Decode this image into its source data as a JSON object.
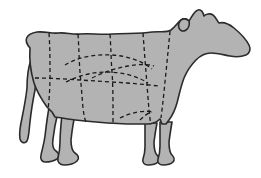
{
  "figure": {
    "subject": "cow",
    "orientation": "facing-right",
    "background_color": "#ffffff",
    "body_fill_color": "#b3b3b3",
    "body_outline_color": "#2b2b2b",
    "body_outline_width": 1.6,
    "cut_line_color": "#1a1a1a",
    "cut_line_width": 1.3,
    "cut_line_dash": "4,3",
    "canvas": {
      "width": 261,
      "height": 178
    }
  },
  "anatomy": {
    "parts": [
      {
        "name": "body",
        "label": "Body"
      },
      {
        "name": "head",
        "label": "Head"
      },
      {
        "name": "ear",
        "label": "Ear"
      },
      {
        "name": "horn",
        "label": "Horn"
      },
      {
        "name": "muzzle",
        "label": "Muzzle"
      },
      {
        "name": "tail",
        "label": "Tail"
      },
      {
        "name": "foreleg-near",
        "label": "Near foreleg"
      },
      {
        "name": "foreleg-far",
        "label": "Far foreleg"
      },
      {
        "name": "hindleg-near",
        "label": "Near hind leg"
      },
      {
        "name": "hindleg-far",
        "label": "Far hind leg"
      },
      {
        "name": "udder",
        "label": "Underline"
      }
    ]
  },
  "shapes": {
    "body_outline_path": "M 30 48 C 23 40 26 34 37 32 C 45 31 52 34 58 33 C 66 32 72 35 80 34 C 90 33 100 35 112 34 C 126 33 140 34 152 32 C 160 31 166 33 171 30 C 175 27 178 22 181 20 C 184 18 187 19 189 21 C 192 17 194 11 198 10 C 201 9 203 12 204 16 C 206 14 210 13 213 15 C 216 17 217 21 219 23 C 223 22 229 24 234 28 C 240 33 246 39 249 45 C 251 49 250 53 246 55 C 241 57 235 57 230 56 C 224 55 217 53 211 53 C 205 53 200 56 196 60 C 191 65 187 71 184 78 C 181 86 179 95 177 103 C 175 110 172 116 169 120 L 166 124 L 162 124 L 160 119 C 157 122 152 124 147 124 L 135 124 C 122 124 108 123 96 122 C 84 121 72 120 62 118 L 55 117 L 52 112 L 47 107 C 42 100 37 92 34 83 C 31 73 29 62 30 48 Z",
    "tail_path": "M 31 60 C 28 68 27 78 27 88 C 26 98 24 108 22 118 C 20 127 19 134 20 139 C 21 143 25 144 27 141 C 29 137 29 130 30 122 C 31 112 33 100 35 90 C 36 80 37 70 37 62 Z",
    "leg_paths": [
      {
        "name": "hindleg-far",
        "d": "M 49 108 C 47 118 46 128 45 136 C 44 144 42 150 41 155 C 40 159 42 162 45 162 C 49 162 54 161 57 159 C 60 157 59 153 56 151 C 53 149 52 145 53 139 C 54 130 56 120 58 112 Z"
      },
      {
        "name": "hindleg-near",
        "d": "M 62 114 C 61 124 60 134 60 142 C 60 149 59 154 58 158 C 57 162 60 165 64 165 C 69 165 74 164 77 161 C 80 158 78 155 75 153 C 72 151 71 146 71 140 C 72 131 73 122 75 116 Z"
      },
      {
        "name": "foreleg-far",
        "d": "M 145 123 C 145 132 145 140 145 147 C 145 152 144 156 143 159 C 142 162 144 165 148 165 C 152 165 156 164 158 162 C 160 160 159 157 157 155 C 155 153 154 148 154 142 C 155 134 156 128 157 123 Z"
      },
      {
        "name": "foreleg-near",
        "d": "M 160 122 C 160 131 160 139 160 146 C 160 151 159 156 158 159 C 157 162 159 165 163 165 C 167 165 171 164 173 162 C 175 160 174 157 172 155 C 170 153 169 148 169 142 C 170 134 171 128 172 122 Z"
      }
    ],
    "cut_lines": [
      {
        "name": "cut-line-chuck-rib-vertical",
        "d": "M 49 33 C 50 48 50 62 50 76 C 50 90 49 100 48 110"
      },
      {
        "name": "cut-line-rib-loin-vertical",
        "d": "M 78 34 C 79 48 79 60 80 72 C 81 84 82 96 83 108 C 84 116 85 120 86 122"
      },
      {
        "name": "cut-line-loin-sirloin-vertical",
        "d": "M 110 34 C 111 48 111 60 112 72 C 113 86 113 100 113 112 C 113 118 113 121 113 123"
      },
      {
        "name": "cut-line-sirloin-round-vertical",
        "d": "M 143 33 C 144 47 145 60 146 72 C 147 85 148 98 149 110 C 150 117 150 121 151 124"
      },
      {
        "name": "cut-line-chuck-neck-vertical",
        "d": "M 170 31 C 169 42 168 52 167 62 C 166 72 165 82 164 92 C 163 102 162 110 161 118"
      },
      {
        "name": "cut-line-horizontal-flank",
        "d": "M 35 78 C 50 78 65 79 80 80 C 96 81 112 82 127 83 C 140 84 150 85 158 86"
      },
      {
        "name": "cut-line-plate-arc-upper",
        "d": "M 65 65 C 78 57 95 54 112 55 C 128 56 142 61 152 69"
      },
      {
        "name": "cut-line-plate-arc-lower",
        "d": "M 66 82 C 78 76 92 72 106 72 C 122 72 137 76 148 83"
      },
      {
        "name": "cut-line-brisket-diagonal",
        "d": "M 92 78 C 104 72 116 68 128 66 C 139 64 148 64 154 66"
      },
      {
        "name": "cut-line-brisket-foot",
        "d": "M 120 118 C 126 115 132 113 138 112 C 144 111 149 111 153 112"
      },
      {
        "name": "cut-line-shank-hook",
        "d": "M 140 120 C 144 116 148 113 152 112"
      }
    ],
    "head_detail_paths": [
      {
        "name": "ear-outline",
        "d": "M 181 20 C 184 18 187 19 189 21 C 190 24 189 28 186 30 C 183 32 180 31 179 28 C 178 25 179 22 181 20 Z"
      }
    ]
  },
  "labels": {
    "alt_text": "Side-view silhouette of a cow divided by dashed lines into butchery cut sections"
  }
}
